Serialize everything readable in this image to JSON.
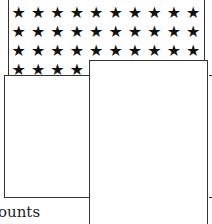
{
  "star_panel": {
    "icon": "star-icon",
    "glyph": "★",
    "rows": [
      {
        "count": 10
      },
      {
        "count": 10
      },
      {
        "count": 10
      },
      {
        "count": 4
      }
    ]
  },
  "cards": [
    {
      "id": "left-card"
    },
    {
      "id": "right-card"
    }
  ],
  "caption": {
    "text": "ounts"
  }
}
